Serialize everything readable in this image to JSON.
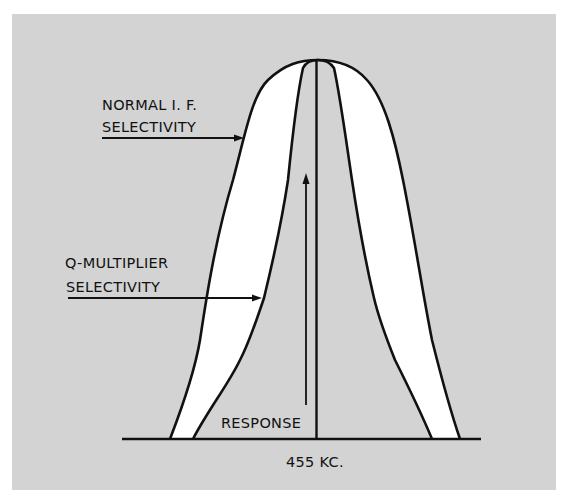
{
  "diagram": {
    "labels": {
      "normal_line1": "NORMAL I. F.",
      "normal_line2": "SELECTIVITY",
      "qmult_line1": "Q-MULTIPLIER",
      "qmult_line2": "SELECTIVITY",
      "response": "RESPONSE",
      "center_freq": "455 KC."
    },
    "colors": {
      "background": "#d3d3d3",
      "fill_between": "#ffffff",
      "stroke": "#111111"
    }
  }
}
